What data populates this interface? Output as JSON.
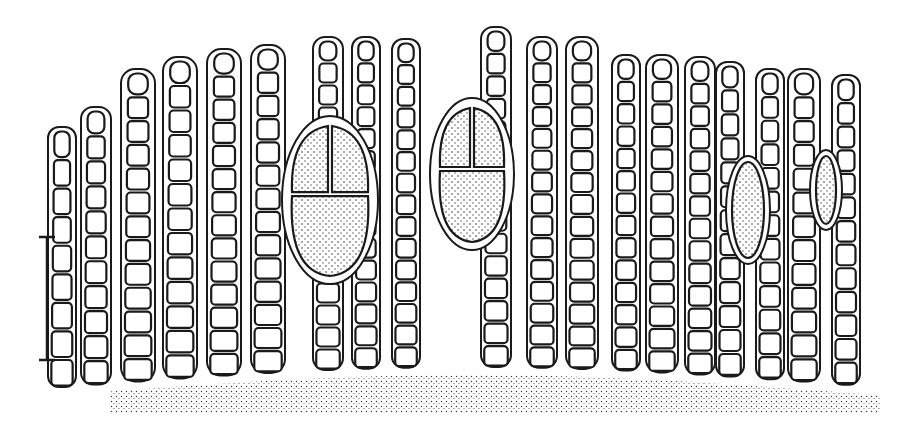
{
  "figure": {
    "colors": {
      "ink": "#1a1a1a",
      "background": "#ffffff"
    },
    "scale_bar": {
      "x": 47,
      "y1": 237,
      "y2": 360
    },
    "base": {
      "y": 385
    },
    "filaments": [
      {
        "x": 62,
        "top": 130,
        "w": 22,
        "n": 9
      },
      {
        "x": 96,
        "top": 110,
        "w": 24,
        "n": 11
      },
      {
        "x": 138,
        "top": 72,
        "w": 28,
        "n": 13
      },
      {
        "x": 180,
        "top": 60,
        "w": 28,
        "n": 13
      },
      {
        "x": 224,
        "top": 52,
        "w": 28,
        "n": 14
      },
      {
        "x": 268,
        "top": 48,
        "w": 28,
        "n": 14
      },
      {
        "x": 328,
        "top": 40,
        "w": 24,
        "n": 15
      },
      {
        "x": 366,
        "top": 40,
        "w": 22,
        "n": 15
      },
      {
        "x": 406,
        "top": 42,
        "w": 22,
        "n": 15
      },
      {
        "x": 496,
        "top": 30,
        "w": 24,
        "n": 15
      },
      {
        "x": 542,
        "top": 40,
        "w": 24,
        "n": 15
      },
      {
        "x": 582,
        "top": 40,
        "w": 26,
        "n": 15
      },
      {
        "x": 626,
        "top": 58,
        "w": 22,
        "n": 14
      },
      {
        "x": 662,
        "top": 58,
        "w": 26,
        "n": 14
      },
      {
        "x": 700,
        "top": 60,
        "w": 24,
        "n": 14
      },
      {
        "x": 730,
        "top": 65,
        "w": 22,
        "n": 13
      },
      {
        "x": 770,
        "top": 72,
        "w": 22,
        "n": 13
      },
      {
        "x": 804,
        "top": 72,
        "w": 26,
        "n": 13
      },
      {
        "x": 846,
        "top": 78,
        "w": 22,
        "n": 13
      }
    ],
    "sporangia": [
      {
        "cx": 330,
        "cy": 200,
        "rx": 42,
        "ry": 78,
        "type": "cruciate"
      },
      {
        "cx": 472,
        "cy": 174,
        "rx": 36,
        "ry": 70,
        "type": "cruciate"
      },
      {
        "cx": 748,
        "cy": 210,
        "rx": 16,
        "ry": 48,
        "type": "elongate"
      },
      {
        "cx": 826,
        "cy": 190,
        "rx": 10,
        "ry": 34,
        "type": "elongate"
      }
    ]
  }
}
